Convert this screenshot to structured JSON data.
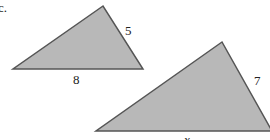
{
  "problem_label": "c.",
  "triangles": [
    {
      "name": "small",
      "side_right": "5",
      "side_bottom": "8"
    },
    {
      "name": "large",
      "side_right": "7",
      "side_bottom": "x"
    }
  ],
  "colors": {
    "fill": "#b8b8b8",
    "stroke": "#555555"
  }
}
